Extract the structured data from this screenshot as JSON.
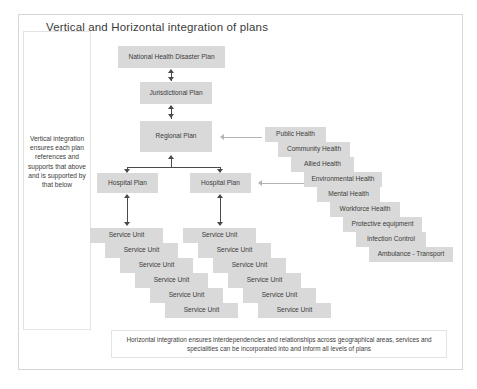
{
  "diagram": {
    "title": "Vertical and Horizontal integration of plans",
    "side_note": "Vertical integration ensures each plan references and supports that above and is supported by that below",
    "bottom_note": "Horizontal integration ensures interdependencies and relationships across geographical areas, services and specialities can be incorporated into and inform all levels of plans",
    "colors": {
      "node_fill": "#d9d9d9",
      "node_text": "#3c3c3c",
      "connector": "#4a4a4a",
      "grey_arrow": "#b3b3b3",
      "frame_border": "#d6d6d6"
    },
    "vertical_chain": [
      {
        "label": "National Health Disaster Plan"
      },
      {
        "label": "Jurisdictional Plan"
      },
      {
        "label": "Regional Plan"
      }
    ],
    "hospital_plans": [
      {
        "label": "Hospital Plan"
      },
      {
        "label": "Hospital Plan"
      }
    ],
    "service_units_left": [
      {
        "label": "Service Unit"
      },
      {
        "label": "Service Unit"
      },
      {
        "label": "Service Unit"
      },
      {
        "label": "Service Unit"
      },
      {
        "label": "Service Unit"
      },
      {
        "label": "Service Unit"
      }
    ],
    "service_units_right": [
      {
        "label": "Service Unit"
      },
      {
        "label": "Service Unit"
      },
      {
        "label": "Service Unit"
      },
      {
        "label": "Service Unit"
      },
      {
        "label": "Service Unit"
      },
      {
        "label": "Service Unit"
      }
    ],
    "horizontal_services": [
      {
        "label": "Public Health"
      },
      {
        "label": "Community Health"
      },
      {
        "label": "Allied Health"
      },
      {
        "label": "Environmental Health"
      },
      {
        "label": "Mental Health"
      },
      {
        "label": "Workforce Health"
      },
      {
        "label": "Protective equipment"
      },
      {
        "label": "Infection Control"
      },
      {
        "label": "Ambulance - Transport"
      }
    ]
  }
}
